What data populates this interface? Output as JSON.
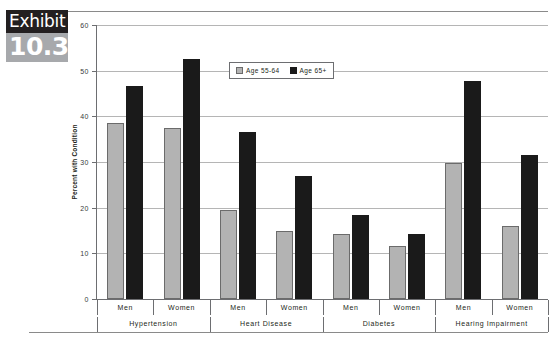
{
  "exhibit": {
    "label": "Exhibit",
    "number": "10.3"
  },
  "chart_data": {
    "type": "bar",
    "title": "",
    "xlabel": "",
    "ylabel": "Percent with Condition",
    "ylim": [
      0,
      60
    ],
    "ytick_values": [
      0,
      10,
      20,
      30,
      40,
      50,
      60
    ],
    "ytick_labels": [
      "0",
      "10",
      "20",
      "30",
      "40",
      "50",
      "60"
    ],
    "grid": true,
    "legend_position": "upper center",
    "groups": [
      "Hypertension",
      "Heart Disease",
      "Diabetes",
      "Hearing Impairment"
    ],
    "subgroups": [
      "Men",
      "Women"
    ],
    "categories": [
      "Hypertension / Men",
      "Hypertension / Women",
      "Heart Disease / Men",
      "Heart Disease / Women",
      "Diabetes / Men",
      "Diabetes / Women",
      "Hearing Impairment / Men",
      "Hearing Impairment / Women"
    ],
    "series": [
      {
        "name": "Age 55-64",
        "color": "#b3b3b3",
        "values": [
          38.5,
          37.5,
          19.5,
          14.8,
          14.3,
          11.5,
          29.7,
          16.0
        ]
      },
      {
        "name": "Age 65+",
        "color": "#1a1a1a",
        "values": [
          46.7,
          52.5,
          36.5,
          27.0,
          18.3,
          14.3,
          47.7,
          31.6
        ]
      }
    ]
  }
}
